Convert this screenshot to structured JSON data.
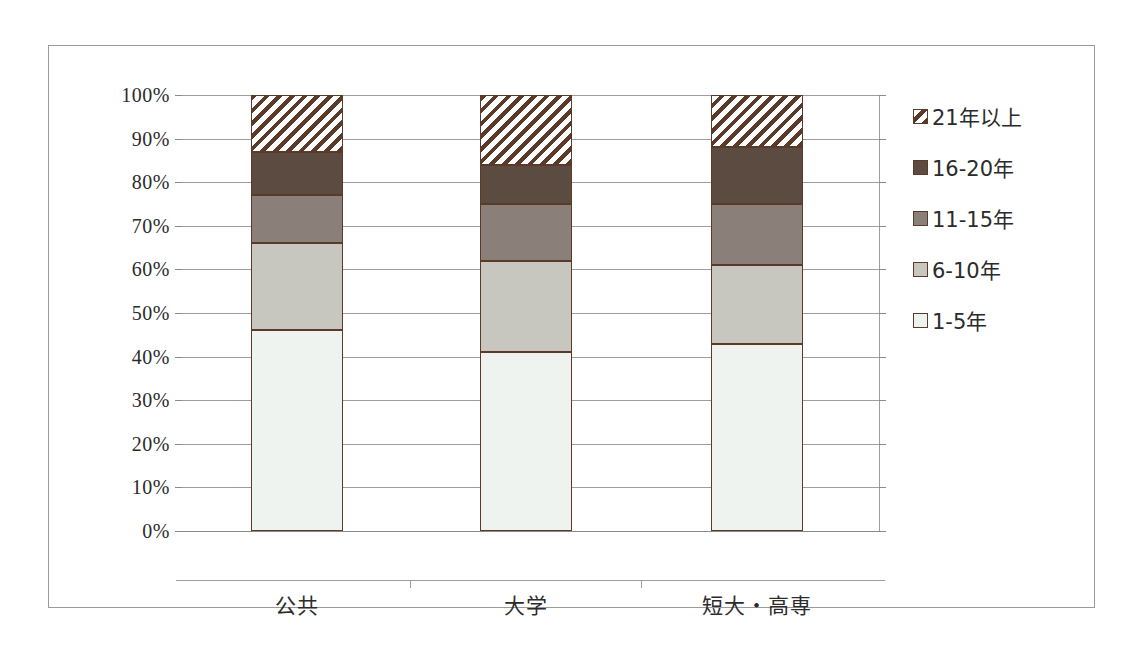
{
  "chart_data": {
    "type": "bar",
    "stacked": true,
    "stack_mode": "percent",
    "title": "",
    "subtitle": "",
    "xlabel": "",
    "ylabel": "",
    "categories": [
      "公共",
      "大学",
      "短大・高専"
    ],
    "ylim": [
      0,
      100
    ],
    "ytick_labels": [
      "0%",
      "10%",
      "20%",
      "30%",
      "40%",
      "50%",
      "60%",
      "70%",
      "80%",
      "90%",
      "100%"
    ],
    "ytick_values": [
      0,
      10,
      20,
      30,
      40,
      50,
      60,
      70,
      80,
      90,
      100
    ],
    "grid": true,
    "legend_position": "right",
    "series": [
      {
        "name": "1-5年",
        "color": "#eef3f0",
        "pattern": "solid",
        "values": [
          46,
          41,
          43
        ]
      },
      {
        "name": "6-10年",
        "color": "#c7c7bf",
        "pattern": "solid",
        "values": [
          20,
          21,
          18
        ]
      },
      {
        "name": "11-15年",
        "color": "#8b8079",
        "pattern": "solid",
        "values": [
          11,
          13,
          14
        ]
      },
      {
        "name": "16-20年",
        "color": "#5b4b41",
        "pattern": "solid",
        "values": [
          10,
          9,
          13
        ]
      },
      {
        "name": "21年以上",
        "color": "#ffffff",
        "pattern": "hatch-diagonal",
        "values": [
          13,
          16,
          12
        ]
      }
    ],
    "legend_order_top_to_bottom": [
      "21年以上",
      "16-20年",
      "11-15年",
      "6-10年",
      "1-5年"
    ]
  },
  "legend": {
    "items": [
      {
        "label": "21年以上",
        "swatch": "legend-swatch-21-plus"
      },
      {
        "label": "16-20年",
        "swatch": "legend-swatch-16-20"
      },
      {
        "label": "11-15年",
        "swatch": "legend-swatch-11-15"
      },
      {
        "label": "6-10年",
        "swatch": "legend-swatch-6-10"
      },
      {
        "label": "1-5年",
        "swatch": "legend-swatch-1-5"
      }
    ]
  },
  "colors": {
    "border": "#5c3a2a",
    "gridline": "#9d9d9d",
    "figure_border": "#9a9a9a",
    "text": "#2b2b2b"
  }
}
